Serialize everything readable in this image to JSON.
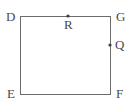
{
  "figure": {
    "type": "geometry-diagram",
    "shape": "rectangle",
    "background_color": "#ffffff",
    "stroke_color": "#6b6b6b",
    "stroke_width": 1,
    "label_color": "#4a4a4a",
    "canvas": {
      "width": 135,
      "height": 112
    },
    "rectangle": {
      "left": 20,
      "top": 16,
      "right": 110,
      "bottom": 94,
      "width": 90,
      "height": 78
    },
    "vertices": [
      {
        "name": "D",
        "label": "D",
        "corner": "top-left",
        "x": 20,
        "y": 16
      },
      {
        "name": "G",
        "label": "G",
        "corner": "top-right",
        "x": 110,
        "y": 16
      },
      {
        "name": "E",
        "label": "E",
        "corner": "bottom-left",
        "x": 20,
        "y": 94
      },
      {
        "name": "F",
        "label": "F",
        "corner": "bottom-right",
        "x": 110,
        "y": 94
      }
    ],
    "marked_points": [
      {
        "name": "R",
        "label": "R",
        "on_edge": "DG",
        "x": 68,
        "y": 16,
        "dot_radius": 1.6
      },
      {
        "name": "Q",
        "label": "Q",
        "on_edge": "GF",
        "x": 110,
        "y": 45,
        "dot_radius": 1.6
      }
    ],
    "edges": [
      {
        "name": "DG",
        "from": "D",
        "to": "G"
      },
      {
        "name": "GF",
        "from": "G",
        "to": "F"
      },
      {
        "name": "FE",
        "from": "F",
        "to": "E"
      },
      {
        "name": "ED",
        "from": "E",
        "to": "D"
      }
    ]
  }
}
